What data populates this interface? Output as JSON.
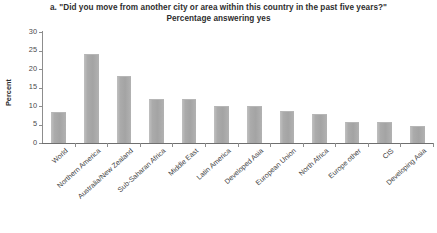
{
  "chart_data": {
    "type": "bar",
    "title": "a. \"Did you move from another city or area within this country in the past five years?\"",
    "subtitle": "Percentage answering yes",
    "xlabel": "",
    "ylabel": "Percent",
    "ylim": [
      0,
      30
    ],
    "yticks": [
      0,
      5,
      10,
      15,
      20,
      25,
      30
    ],
    "grid": false,
    "legend": null,
    "bar_color": "#a9a9a9",
    "categories": [
      "World",
      "Northern America",
      "Australia/New Zealand",
      "Sub-Saharan Africa",
      "Middle East",
      "Latin America",
      "Developed Asia",
      "European Union",
      "North Africa",
      "Europe other",
      "CIS",
      "Developing Asia"
    ],
    "values": [
      8.0,
      23.9,
      17.8,
      11.6,
      11.6,
      9.7,
      9.6,
      8.4,
      7.5,
      5.4,
      5.4,
      4.3
    ]
  }
}
